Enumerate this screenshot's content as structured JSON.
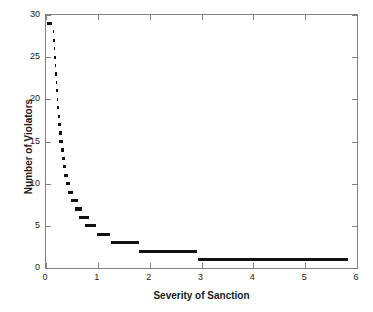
{
  "chart_data": {
    "type": "scatter",
    "title": "",
    "xlabel": "Severity of Sanction",
    "ylabel": "Number of Violators",
    "xlim": [
      0,
      6
    ],
    "ylim": [
      0,
      30
    ],
    "xticks": [
      0,
      1,
      2,
      3,
      4,
      5,
      6
    ],
    "xticklabels": [
      "0",
      "1",
      "2",
      "3",
      "4",
      "5",
      "6"
    ],
    "yticks": [
      0,
      5,
      10,
      15,
      20,
      25,
      30
    ],
    "yticklabels": [
      "0",
      "5",
      "10",
      "15",
      "20",
      "25",
      "30"
    ],
    "grid": false,
    "legend": false,
    "marker_color": "#111111",
    "axis_color": "#808080",
    "series": [
      {
        "name": "Violators vs Severity",
        "points": [
          {
            "y": 29,
            "x_start": 0.02,
            "x_end": 0.11
          },
          {
            "y": 28,
            "x_start": 0.13,
            "x_end": 0.16
          },
          {
            "y": 27,
            "x_start": 0.14,
            "x_end": 0.17
          },
          {
            "y": 26,
            "x_start": 0.15,
            "x_end": 0.18
          },
          {
            "y": 25,
            "x_start": 0.16,
            "x_end": 0.19
          },
          {
            "y": 24,
            "x_start": 0.17,
            "x_end": 0.2
          },
          {
            "y": 23,
            "x_start": 0.18,
            "x_end": 0.21
          },
          {
            "y": 22,
            "x_start": 0.19,
            "x_end": 0.22
          },
          {
            "y": 21,
            "x_start": 0.2,
            "x_end": 0.23
          },
          {
            "y": 20,
            "x_start": 0.21,
            "x_end": 0.24
          },
          {
            "y": 19,
            "x_start": 0.22,
            "x_end": 0.26
          },
          {
            "y": 18,
            "x_start": 0.23,
            "x_end": 0.27
          },
          {
            "y": 17,
            "x_start": 0.24,
            "x_end": 0.28
          },
          {
            "y": 16,
            "x_start": 0.25,
            "x_end": 0.3
          },
          {
            "y": 15,
            "x_start": 0.26,
            "x_end": 0.32
          },
          {
            "y": 14,
            "x_start": 0.28,
            "x_end": 0.34
          },
          {
            "y": 13,
            "x_start": 0.3,
            "x_end": 0.36
          },
          {
            "y": 12,
            "x_start": 0.32,
            "x_end": 0.39
          },
          {
            "y": 11,
            "x_start": 0.35,
            "x_end": 0.43
          },
          {
            "y": 10,
            "x_start": 0.38,
            "x_end": 0.47
          },
          {
            "y": 9,
            "x_start": 0.42,
            "x_end": 0.53
          },
          {
            "y": 8,
            "x_start": 0.48,
            "x_end": 0.61
          },
          {
            "y": 7,
            "x_start": 0.55,
            "x_end": 0.7
          },
          {
            "y": 6,
            "x_start": 0.64,
            "x_end": 0.82
          },
          {
            "y": 5,
            "x_start": 0.76,
            "x_end": 0.97
          },
          {
            "y": 4,
            "x_start": 0.98,
            "x_end": 1.24
          },
          {
            "y": 3,
            "x_start": 1.25,
            "x_end": 1.8
          },
          {
            "y": 2,
            "x_start": 1.8,
            "x_end": 2.92
          },
          {
            "y": 1,
            "x_start": 2.93,
            "x_end": 5.83
          }
        ]
      }
    ]
  }
}
